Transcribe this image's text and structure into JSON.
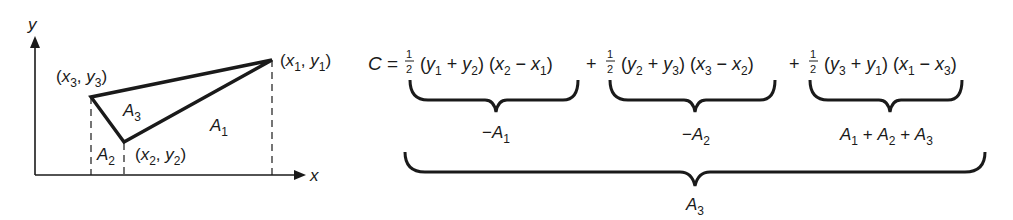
{
  "figure": {
    "axes": {
      "x_label": "x",
      "y_label": "y"
    },
    "vertices": [
      {
        "name": "p1",
        "label": "(x1, y1)",
        "x": "x",
        "xsub": "1",
        "y": "y",
        "ysub": "1"
      },
      {
        "name": "p2",
        "label": "(x2, y2)",
        "x": "x",
        "xsub": "2",
        "y": "y",
        "ysub": "2"
      },
      {
        "name": "p3",
        "label": "(x3, y3)",
        "x": "x",
        "xsub": "3",
        "y": "y",
        "ysub": "3"
      }
    ],
    "regions": [
      {
        "label": "A",
        "sub": "1"
      },
      {
        "label": "A",
        "sub": "2"
      },
      {
        "label": "A",
        "sub": "3"
      }
    ]
  },
  "formula": {
    "lhs": "C",
    "equals": "=",
    "terms": [
      {
        "coef_num": "1",
        "coef_den": "2",
        "text": "(y1 + y2) (x2 − x1)",
        "brace_label": "−A1"
      },
      {
        "coef_num": "1",
        "coef_den": "2",
        "text": "(y2 + y3) (x3 − x2)",
        "brace_label": "−A2"
      },
      {
        "coef_num": "1",
        "coef_den": "2",
        "text": "(y3 + y1) (x1 − x3)",
        "brace_label": "A1 + A2 + A3"
      }
    ],
    "total_brace_label": "A3"
  }
}
